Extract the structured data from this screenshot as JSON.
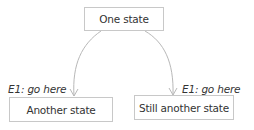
{
  "diagram": {
    "type": "state-diagram",
    "colors": {
      "box_border": "#c8c8c8",
      "text": "#333333",
      "edge": "#b8b8b8",
      "background": "#ffffff"
    },
    "states": [
      {
        "id": "one",
        "label": "One state"
      },
      {
        "id": "another",
        "label": "Another state"
      },
      {
        "id": "still_another",
        "label": "Still another state"
      }
    ],
    "transitions": [
      {
        "from": "one",
        "to": "another",
        "label": "E1: go here"
      },
      {
        "from": "one",
        "to": "still_another",
        "label": "E1: go here"
      }
    ]
  }
}
